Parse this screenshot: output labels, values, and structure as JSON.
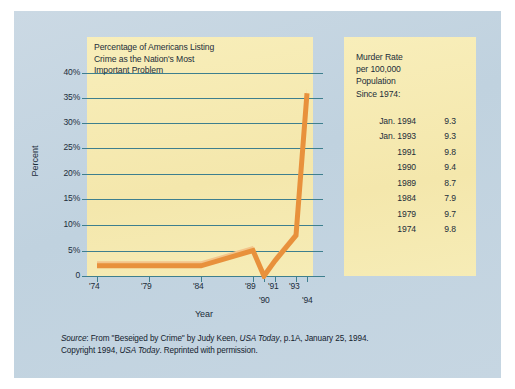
{
  "figure": {
    "background_color": "#c3d4e0",
    "panel_color": "#f6eab2",
    "grid_color": "#3e7f8e",
    "series_color": "#e8913c"
  },
  "chart_data": {
    "type": "line",
    "title_lines": [
      "Percentage of Americans Listing",
      "Crime as the Nation's Most",
      "Important Problem"
    ],
    "title": "Percentage of Americans Listing Crime as the Nation's Most Important Problem",
    "xlabel": "Year",
    "ylabel": "Percent",
    "ylim": [
      0,
      40
    ],
    "ytick_labels": [
      "40%",
      "35%",
      "30%",
      "25%",
      "20%",
      "15%",
      "10%",
      "5%",
      "0"
    ],
    "ytick_values": [
      40,
      35,
      30,
      25,
      20,
      15,
      10,
      5,
      0
    ],
    "xtick_labels": [
      "'74",
      "'79",
      "'84",
      "'89",
      "'90",
      "'91",
      "'93",
      "'94"
    ],
    "x": [
      1974,
      1979,
      1984,
      1989,
      1990,
      1991,
      1993,
      1994
    ],
    "values": [
      2,
      2,
      2,
      5,
      0,
      3,
      8,
      36
    ],
    "grid": true,
    "legend": "none"
  },
  "side_table": {
    "heading_lines": [
      "Murder Rate",
      "per 100,000",
      "Population",
      "Since 1974:"
    ],
    "rows": [
      {
        "label": "Jan. 1994",
        "value": "9.3"
      },
      {
        "label": "Jan. 1993",
        "value": "9.3"
      },
      {
        "label": "1991",
        "value": "9.8"
      },
      {
        "label": "1990",
        "value": "9.4"
      },
      {
        "label": "1989",
        "value": "8.7"
      },
      {
        "label": "1984",
        "value": "7.9"
      },
      {
        "label": "1979",
        "value": "9.7"
      },
      {
        "label": "1974",
        "value": "9.8"
      }
    ]
  },
  "source": {
    "line1_a": "Source",
    "line1_b": ": From  \"Beseiged by Crime\" by Judy Keen, ",
    "line1_c": "USA Today",
    "line1_d": ", p.1A, January 25, 1994.",
    "line2_a": "Copyright 1994, ",
    "line2_b": "USA Today",
    "line2_c": ". Reprinted with permission."
  }
}
